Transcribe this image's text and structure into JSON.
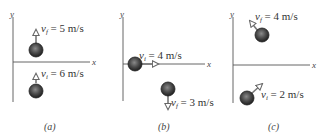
{
  "panels": [
    {
      "id": "a",
      "caption": "(a)",
      "axis_x": "x",
      "axis_y": "y",
      "top": {
        "label_var": "v",
        "label_sub": "f",
        "label_value": " = 5 m/s",
        "direction": "up"
      },
      "bottom": {
        "label_var": "v",
        "label_sub": "i",
        "label_value": " = 6 m/s",
        "direction": "up"
      }
    },
    {
      "id": "b",
      "caption": "(b)",
      "axis_x": "x",
      "axis_y": "y",
      "top": {
        "label_var": "v",
        "label_sub": "i",
        "label_value": " = 4 m/s",
        "direction": "right"
      },
      "bottom": {
        "label_var": "v",
        "label_sub": "f",
        "label_value": " = 3 m/s",
        "direction": "down"
      }
    },
    {
      "id": "c",
      "caption": "(c)",
      "axis_x": "x",
      "axis_y": "y",
      "top": {
        "label_var": "v",
        "label_sub": "f",
        "label_value": " = 4 m/s",
        "direction": "up-left"
      },
      "bottom": {
        "label_var": "v",
        "label_sub": "i",
        "label_value": " = 2 m/s",
        "direction": "up-right"
      }
    }
  ],
  "colors": {
    "ball_dark": "#2a2a2a",
    "ball_mid": "#6b6b6b",
    "axis": "#555555",
    "arrow": "#777777"
  }
}
